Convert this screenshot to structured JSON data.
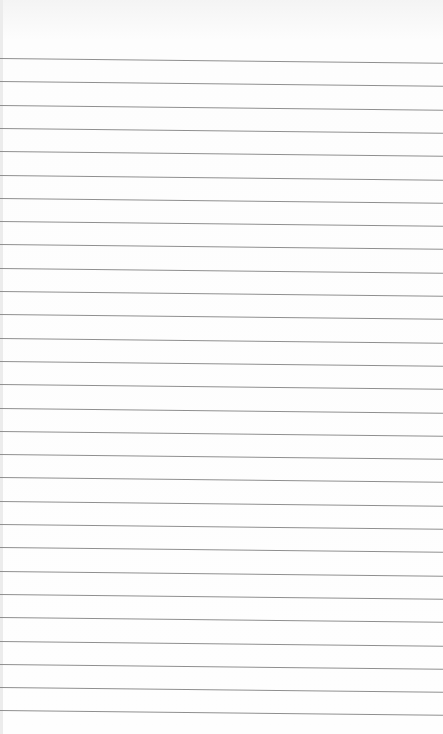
{
  "image": {
    "description": "Blank lined notebook paper",
    "background_color": "#fdfdfd",
    "line_color": "#8f8f8f",
    "line_count": 29,
    "first_line_y": 58,
    "line_spacing": 23.3,
    "line_slope_deg": 0.6
  }
}
